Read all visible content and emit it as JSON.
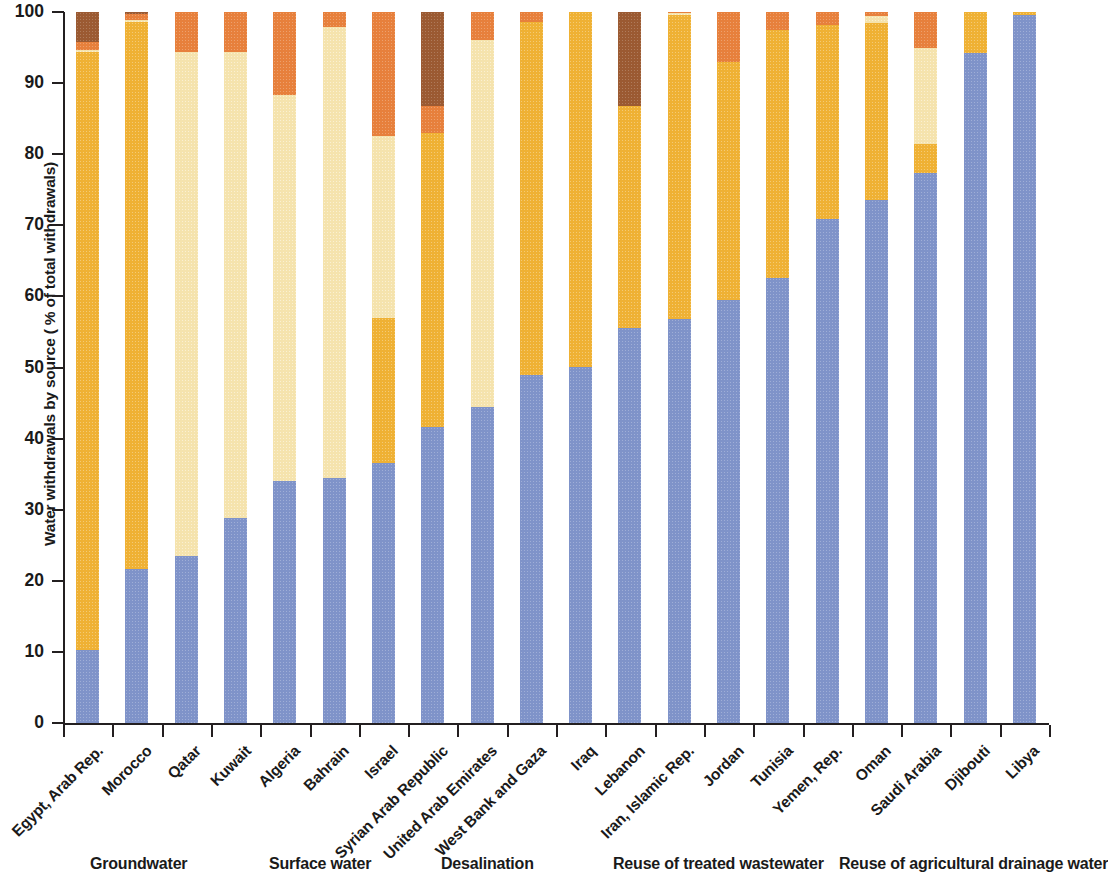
{
  "chart_data": {
    "type": "bar",
    "stacked": true,
    "title": "",
    "xlabel": "",
    "ylabel": "Water withdrawals by source ( % of total withdrawals)",
    "ylim": [
      0,
      100
    ],
    "ytick_labels": [
      "0",
      "10",
      "20",
      "30",
      "40",
      "50",
      "60",
      "70",
      "80",
      "90",
      "100"
    ],
    "ytick_values": [
      0,
      10,
      20,
      30,
      40,
      50,
      60,
      70,
      80,
      90,
      100
    ],
    "grid": false,
    "legend_position": "bottom",
    "categories": [
      "Egypt, Arab Rep.",
      "Morocco",
      "Qatar",
      "Kuwait",
      "Algeria",
      "Bahrain",
      "Israel",
      "Syrian Arab Republic",
      "United Arab Emirates",
      "West Bank and Gaza",
      "Iraq",
      "Lebanon",
      "Iran, Islamic Rep.",
      "Jordan",
      "Tunisia",
      "Yemen, Rep.",
      "Oman",
      "Saudi Arabia",
      "Djibouti",
      "Libya"
    ],
    "series": [
      {
        "name": "Groundwater",
        "color": "#7f93c9",
        "values": [
          10.3,
          21.7,
          23.5,
          28.8,
          34.0,
          34.4,
          36.6,
          41.7,
          44.4,
          48.9,
          50.1,
          55.5,
          56.8,
          59.5,
          62.6,
          70.9,
          73.6,
          77.4,
          94.3,
          99.6
        ]
      },
      {
        "name": "Surface water",
        "color": "#efb134",
        "values": [
          84.1,
          76.9,
          0.0,
          0.0,
          0.0,
          0.0,
          20.4,
          41.3,
          0.0,
          49.7,
          49.9,
          31.3,
          42.8,
          33.5,
          34.9,
          27.3,
          24.9,
          4.1,
          5.7,
          0.4
        ]
      },
      {
        "name": "Desalination",
        "color": "#f5e3ad",
        "values": [
          0.2,
          0.3,
          70.9,
          65.6,
          54.3,
          63.5,
          25.5,
          0.0,
          51.6,
          0.0,
          0.0,
          0.0,
          0.2,
          0.0,
          0.0,
          0.0,
          0.9,
          13.4,
          0.0,
          0.0
        ]
      },
      {
        "name": "Reuse of treated wastewater",
        "color": "#e7803c",
        "values": [
          1.2,
          0.8,
          5.6,
          5.6,
          11.7,
          2.1,
          17.5,
          3.8,
          4.0,
          1.4,
          0.0,
          0.0,
          0.2,
          7.0,
          2.5,
          1.8,
          0.6,
          5.1,
          0.0,
          0.0
        ]
      },
      {
        "name": "Reuse of agricultural drainage water",
        "color": "#9b5a32",
        "values": [
          4.2,
          0.3,
          0.0,
          0.0,
          0.0,
          0.0,
          0.0,
          13.2,
          0.0,
          0.0,
          0.0,
          13.2,
          0.0,
          0.0,
          0.0,
          0.0,
          0.0,
          0.0,
          0.0,
          0.0
        ]
      }
    ]
  }
}
